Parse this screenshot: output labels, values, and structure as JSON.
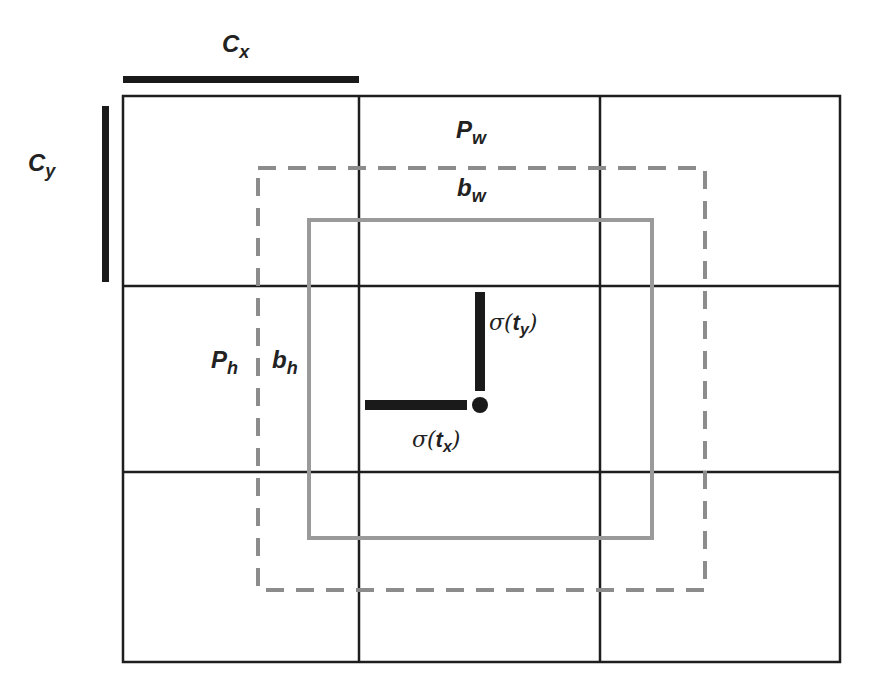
{
  "colors": {
    "grid": "#1e1e1e",
    "prior_box": "#8c8c8c",
    "predicted_box": "#9a9a9a",
    "offset_bars": "#1a1a1a",
    "background": "#ffffff"
  },
  "grid": {
    "rows": 3,
    "cols": 3
  },
  "labels": {
    "cx": {
      "main": "C",
      "sub": "x"
    },
    "cy": {
      "main": "C",
      "sub": "y"
    },
    "pw": {
      "main": "P",
      "sub": "w"
    },
    "bw": {
      "main": "b",
      "sub": "w"
    },
    "ph": {
      "main": "P",
      "sub": "h"
    },
    "bh": {
      "main": "b",
      "sub": "h"
    },
    "sigma_ty": {
      "fn": "σ(",
      "var": "t",
      "sub": "y",
      "close": ")"
    },
    "sigma_tx": {
      "fn": "σ(",
      "var": "t",
      "sub": "x",
      "close": ")"
    }
  },
  "legend": {
    "prior_box": "dashed: prior (anchor) box P",
    "predicted_box": "solid gray: predicted box b"
  }
}
